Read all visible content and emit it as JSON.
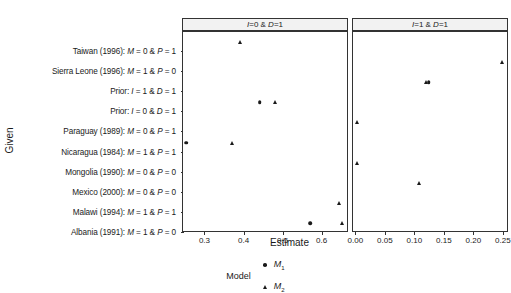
{
  "chart_data": {
    "type": "scatter",
    "title": "",
    "xlabel": "Estimate",
    "ylabel": "Given",
    "grid": false,
    "legend": {
      "title": "Model",
      "position": "bottom",
      "entries": [
        {
          "label": "M",
          "sub": "1",
          "symbol": "circle"
        },
        {
          "label": "M",
          "sub": "2",
          "symbol": "triangle"
        }
      ]
    },
    "categories": [
      "Taiwan (1996): M = 0 & P = 1",
      "Sierra Leone (1996): M = 1 & P = 0",
      "Prior: I = 1  & D = 1",
      "Prior: I = 0  & D = 1",
      "Paraguay (1989): M = 0 & P = 1",
      "Nicaragua (1984): M = 1 & P = 1",
      "Mongolia (1990): M = 0 & P = 0",
      "Mexico (2000): M = 0 & P = 0",
      "Malawi (1994): M = 1 & P = 1",
      "Albania (1991): M = 1 & P = 0"
    ],
    "panels": [
      {
        "label": "I=0 & D=1",
        "xlim": [
          0.245,
          0.665
        ],
        "ticks": [
          0.3,
          0.4,
          0.5,
          0.6
        ],
        "ticklabels": [
          "0.3",
          "0.4",
          "0.5",
          "0.6"
        ],
        "points": [
          {
            "category": "Taiwan (1996): M = 0 & P = 1",
            "model": "M2",
            "symbol": "triangle",
            "x": 0.392
          },
          {
            "category": "Prior: I = 0  & D = 1",
            "model": "M1",
            "symbol": "circle",
            "x": 0.441
          },
          {
            "category": "Prior: I = 0  & D = 1",
            "model": "M2",
            "symbol": "triangle",
            "x": 0.481
          },
          {
            "category": "Nicaragua (1984): M = 1 & P = 1",
            "model": "M1",
            "symbol": "circle",
            "x": 0.253
          },
          {
            "category": "Nicaragua (1984): M = 1 & P = 1",
            "model": "M2",
            "symbol": "triangle",
            "x": 0.37
          },
          {
            "category": "Malawi (1994): M = 1 & P = 1",
            "model": "M2",
            "symbol": "triangle",
            "x": 0.645
          },
          {
            "category": "Albania (1991): M = 1 & P = 0",
            "model": "M1",
            "symbol": "circle",
            "x": 0.571
          },
          {
            "category": "Albania (1991): M = 1 & P = 0",
            "model": "M2",
            "symbol": "triangle",
            "x": 0.653
          }
        ]
      },
      {
        "label": "I=1 & D=1",
        "xlim": [
          -0.004,
          0.257
        ],
        "ticks": [
          0.0,
          0.05,
          0.1,
          0.15,
          0.2,
          0.25
        ],
        "ticklabels": [
          "0.00",
          "0.05",
          "0.10",
          "0.15",
          "0.20",
          "0.25"
        ],
        "points": [
          {
            "category": "Sierra Leone (1996): M = 1 & P = 0",
            "model": "M2",
            "symbol": "triangle",
            "x": 0.249
          },
          {
            "category": "Prior: I = 1  & D = 1",
            "model": "M1",
            "symbol": "circle",
            "x": 0.124
          },
          {
            "category": "Prior: I = 1  & D = 1",
            "model": "M2",
            "symbol": "triangle",
            "x": 0.119
          },
          {
            "category": "Paraguay (1989): M = 0 & P = 1",
            "model": "M2",
            "symbol": "triangle",
            "x": 0.003
          },
          {
            "category": "Mongolia (1990): M = 0 & P = 0",
            "model": "M2",
            "symbol": "triangle",
            "x": 0.003
          },
          {
            "category": "Mexico (2000): M = 0 & P = 0",
            "model": "M2",
            "symbol": "triangle",
            "x": 0.108
          }
        ]
      }
    ],
    "colors": {
      "point": "#1a1a1a",
      "strip_bg": "#f2f2f2",
      "panel_border": "#333333"
    }
  }
}
